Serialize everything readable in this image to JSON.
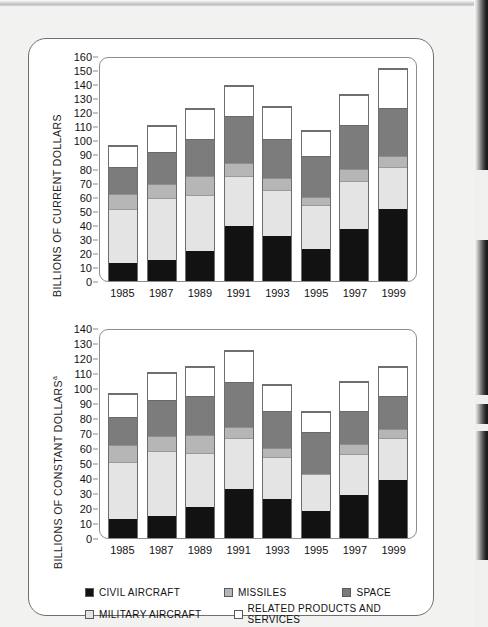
{
  "figure": {
    "ylabel_top": "BILLIONS OF CURRENT DOLLARS",
    "ylabel_bottom": "BILLIONS OF CONSTANT DOLLARS",
    "ylabel_bottom_sup": "a"
  },
  "legend": {
    "items": [
      {
        "key": "civil",
        "label": "CIVIL AIRCRAFT",
        "color": "#121212"
      },
      {
        "key": "missiles",
        "label": "MISSILES",
        "color": "#b6b6b6"
      },
      {
        "key": "space",
        "label": "SPACE",
        "color": "#7c7c7c"
      },
      {
        "key": "military",
        "label": "MILITARY AIRCRAFT",
        "color": "#e4e4e4"
      },
      {
        "key": "related",
        "label": "RELATED PRODUCTS AND SERVICES",
        "color": "#ffffff"
      }
    ]
  },
  "chart_data": [
    {
      "type": "bar",
      "stacked": true,
      "title": "",
      "xlabel": "",
      "ylabel": "BILLIONS OF CURRENT DOLLARS",
      "ylim": [
        0,
        160
      ],
      "ytick_step": 10,
      "yticks": [
        0,
        10,
        20,
        30,
        40,
        50,
        60,
        70,
        80,
        90,
        100,
        110,
        120,
        130,
        140,
        150,
        160
      ],
      "grid": false,
      "categories": [
        "1985",
        "1987",
        "1989",
        "1991",
        "1993",
        "1995",
        "1997",
        "1999"
      ],
      "series": [
        {
          "name": "CIVIL AIRCRAFT",
          "color": "#121212",
          "values": [
            13,
            15,
            21,
            39,
            32,
            23,
            37,
            51
          ]
        },
        {
          "name": "MILITARY AIRCRAFT",
          "color": "#e4e4e4",
          "values": [
            38,
            44,
            40,
            36,
            33,
            31,
            34,
            30
          ]
        },
        {
          "name": "MISSILES",
          "color": "#b6b6b6",
          "values": [
            11,
            10,
            14,
            9,
            8,
            6,
            9,
            8
          ]
        },
        {
          "name": "SPACE",
          "color": "#7c7c7c",
          "values": [
            19,
            23,
            26,
            33,
            28,
            29,
            31,
            34
          ]
        },
        {
          "name": "RELATED PRODUCTS AND SERVICES",
          "color": "#ffffff",
          "values": [
            15,
            18,
            21,
            22,
            23,
            18,
            21,
            28
          ]
        }
      ],
      "totals": [
        96,
        110,
        122,
        139,
        124,
        107,
        132,
        151
      ]
    },
    {
      "type": "bar",
      "stacked": true,
      "title": "",
      "xlabel": "",
      "ylabel": "BILLIONS OF CONSTANT DOLLARS",
      "ylim": [
        0,
        140
      ],
      "ytick_step": 10,
      "yticks": [
        0,
        10,
        20,
        30,
        40,
        50,
        60,
        70,
        80,
        90,
        100,
        110,
        120,
        130,
        140
      ],
      "grid": false,
      "categories": [
        "1985",
        "1987",
        "1989",
        "1991",
        "1993",
        "1995",
        "1997",
        "1999"
      ],
      "series": [
        {
          "name": "CIVIL AIRCRAFT",
          "color": "#121212",
          "values": [
            13,
            15,
            21,
            33,
            26,
            18,
            29,
            39
          ]
        },
        {
          "name": "MILITARY AIRCRAFT",
          "color": "#e4e4e4",
          "values": [
            38,
            43,
            36,
            34,
            28,
            25,
            27,
            28
          ]
        },
        {
          "name": "MISSILES",
          "color": "#b6b6b6",
          "values": [
            11,
            10,
            12,
            7,
            6,
            0,
            7,
            6
          ]
        },
        {
          "name": "SPACE",
          "color": "#7c7c7c",
          "values": [
            19,
            24,
            26,
            30,
            25,
            28,
            22,
            22
          ]
        },
        {
          "name": "RELATED PRODUCTS AND SERVICES",
          "color": "#ffffff",
          "values": [
            15,
            18,
            19,
            21,
            17,
            13,
            19,
            19
          ]
        }
      ],
      "totals": [
        96,
        110,
        114,
        125,
        102,
        84,
        104,
        114
      ]
    }
  ]
}
